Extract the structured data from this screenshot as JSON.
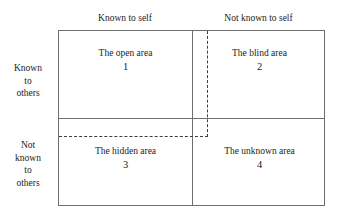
{
  "figure": {
    "name": "johari-window",
    "background_color": "#ffffff",
    "line_color": "#6e6e6e",
    "dashed_line_color": "#3c3c3c",
    "text_color": "#1c1c1c"
  },
  "column_headers": [
    {
      "id": "known-self",
      "label": "Known to self"
    },
    {
      "id": "not-known-self",
      "label": "Not known to self"
    }
  ],
  "row_labels": [
    {
      "id": "known-others",
      "lines": [
        "Known",
        "to",
        "others"
      ]
    },
    {
      "id": "not-known-others",
      "lines": [
        "Not",
        "known",
        "to",
        "others"
      ]
    }
  ],
  "quadrants": [
    {
      "id": "open",
      "title": "The open area",
      "number": "1"
    },
    {
      "id": "blind",
      "title": "The blind area",
      "number": "2"
    },
    {
      "id": "hidden",
      "title": "The hidden area",
      "number": "3"
    },
    {
      "id": "unknown",
      "title": "The unknown area",
      "number": "4"
    }
  ]
}
